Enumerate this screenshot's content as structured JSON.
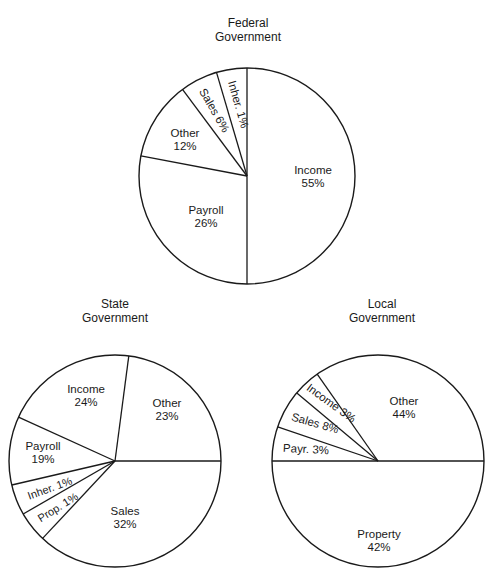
{
  "chart_data": [
    {
      "type": "pie",
      "title": "Federal Government",
      "title_lines": [
        "Federal",
        "Government"
      ],
      "slices": [
        {
          "label": "Income",
          "value": 55,
          "text": "55%"
        },
        {
          "label": "Payroll",
          "value": 26,
          "text": "26%"
        },
        {
          "label": "Other",
          "value": 12,
          "text": "12%"
        },
        {
          "label": "Sales",
          "value": 6,
          "text": "Sales 6%"
        },
        {
          "label": "Inher.",
          "value": 1,
          "text": "Inher. 1%"
        }
      ],
      "unit": "%",
      "layout": {
        "cx": 247,
        "cy": 176,
        "r": 108,
        "boundary_angles_deg": [
          -90,
          90,
          -169.2,
          -126.7,
          -106.4
        ]
      }
    },
    {
      "type": "pie",
      "title": "State Government",
      "title_lines": [
        "State",
        "Government"
      ],
      "slices": [
        {
          "label": "Other",
          "value": 23,
          "text": "23%"
        },
        {
          "label": "Sales",
          "value": 32,
          "text": "32%"
        },
        {
          "label": "Prop.",
          "value": 1,
          "text": "Prop. 1%"
        },
        {
          "label": "Inher.",
          "value": 1,
          "text": "Inher. 1%"
        },
        {
          "label": "Payroll",
          "value": 19,
          "text": "19%"
        },
        {
          "label": "Income",
          "value": 24,
          "text": "24%"
        }
      ],
      "unit": "%",
      "layout": {
        "cx": 115,
        "cy": 461,
        "r": 106,
        "boundary_angles_deg": [
          0,
          133.1,
          150.0,
          166.9,
          -155.6,
          -82.5
        ]
      }
    },
    {
      "type": "pie",
      "title": "Local Government",
      "title_lines": [
        "Local",
        "Government"
      ],
      "slices": [
        {
          "label": "Property",
          "value": 42,
          "text": "42%"
        },
        {
          "label": "Payr.",
          "value": 3,
          "text": "Payr. 3%"
        },
        {
          "label": "Sales",
          "value": 8,
          "text": "Sales 8%"
        },
        {
          "label": "Income",
          "value": 3,
          "text": "Income 3%"
        },
        {
          "label": "Other",
          "value": 44,
          "text": "44%"
        }
      ],
      "unit": "%",
      "layout": {
        "cx": 378,
        "cy": 461,
        "r": 106,
        "boundary_angles_deg": [
          0,
          180,
          -161.2,
          -140.0,
          -125.0
        ]
      }
    }
  ],
  "labels": {
    "federal": {
      "title1": "Federal",
      "title2": "Government",
      "income_name": "Income",
      "income_pct": "55%",
      "payroll_name": "Payroll",
      "payroll_pct": "26%",
      "other_name": "Other",
      "other_pct": "12%",
      "sales": "Sales 6%",
      "inher": "Inher. 1%"
    },
    "state": {
      "title1": "State",
      "title2": "Government",
      "income_name": "Income",
      "income_pct": "24%",
      "other_name": "Other",
      "other_pct": "23%",
      "payroll_name": "Payroll",
      "payroll_pct": "19%",
      "inher": "Inher. 1%",
      "prop": "Prop. 1%",
      "sales_name": "Sales",
      "sales_pct": "32%"
    },
    "local": {
      "title1": "Local",
      "title2": "Government",
      "other_name": "Other",
      "other_pct": "44%",
      "income": "Income 3%",
      "sales": "Sales 8%",
      "payr": "Payr. 3%",
      "property_name": "Property",
      "property_pct": "42%"
    }
  },
  "colors": {
    "stroke": "#1a1a1a",
    "fill": "#ffffff",
    "background": "#ffffff"
  }
}
